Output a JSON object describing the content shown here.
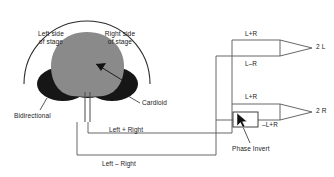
{
  "figure": {
    "type": "mid-side-microphone-matrix-diagram",
    "background_color": "#ffffff",
    "line_color": "#3a3a3a",
    "cardioid_color": "#8a8a8a",
    "bidirectional_color": "#161616"
  },
  "stage_labels": {
    "left": "Left side\nof stage",
    "left_line1": "Left side",
    "left_line2": "of stage",
    "right_line1": "Right side",
    "right_line2": "of stage"
  },
  "pattern_labels": {
    "cardioid": "Cardioid",
    "bidirectional": "Bidirectional"
  },
  "signal_labels": {
    "left_plus_right": "Left + Right",
    "left_minus_right": "Left – Right"
  },
  "matrix_labels": {
    "top_sum_a": "L+R",
    "top_sum_b": "L–R",
    "bottom_sum_a": "L+R",
    "bottom_sum_b": "–L+R"
  },
  "outputs": {
    "left": "2 L",
    "right": "2 R"
  },
  "phase_invert": {
    "label": "Phase Invert"
  },
  "cursor": {
    "name": "mouse-pointer",
    "x": 237,
    "y": 117
  }
}
